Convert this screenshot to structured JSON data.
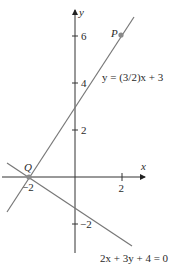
{
  "figure": {
    "type": "coordinate-plane-lines",
    "colors": {
      "axes": "#333333",
      "lines": "#777777",
      "points": "#8a8a8a",
      "text": "#2a2a2a"
    },
    "axes": {
      "x_label": "x",
      "y_label": "y",
      "x_ticks": [
        {
          "value": -2,
          "label": "−2"
        },
        {
          "value": 2,
          "label": "2"
        }
      ],
      "y_ticks": [
        {
          "value": 6,
          "label": "6"
        },
        {
          "value": 4,
          "label": "4"
        },
        {
          "value": 2,
          "label": "2"
        },
        {
          "value": -2,
          "label": "−2"
        }
      ]
    },
    "lines": [
      {
        "name": "line-1",
        "equation": "y = (3/2)x + 3"
      },
      {
        "name": "line-2",
        "equation": "2x + 3y + 4 = 0"
      }
    ],
    "points": [
      {
        "name": "P",
        "label": "P",
        "x": 2,
        "y": 6
      },
      {
        "name": "Q",
        "label": "Q",
        "x": -2,
        "y": 0
      }
    ]
  }
}
